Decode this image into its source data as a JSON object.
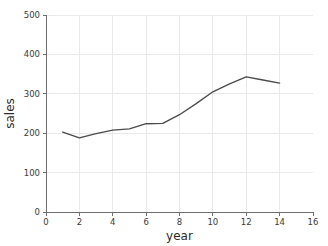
{
  "chart_data": {
    "type": "line",
    "title": "",
    "xlabel": "year",
    "ylabel": "sales",
    "xlim": [
      0,
      16
    ],
    "ylim": [
      0,
      500
    ],
    "grid": true,
    "legend": false,
    "x_ticks": [
      0,
      2,
      4,
      6,
      8,
      10,
      12,
      14,
      16
    ],
    "y_ticks": [
      0,
      100,
      200,
      300,
      400,
      500
    ],
    "x_tick_labels": [
      "0",
      "2",
      "4",
      "6",
      "8",
      "10",
      "12",
      "14",
      "16"
    ],
    "y_tick_labels": [
      "0",
      "100",
      "200",
      "300",
      "400",
      "500"
    ],
    "series": [
      {
        "name": "sales",
        "color": "#4a4a4a",
        "x": [
          1,
          2,
          3,
          4,
          5,
          6,
          7,
          8,
          9,
          10,
          11,
          12,
          13,
          14
        ],
        "values": [
          203,
          188,
          199,
          208,
          211,
          224,
          225,
          247,
          275,
          305,
          325,
          343,
          335,
          327
        ]
      }
    ]
  },
  "figure": {
    "background_color": "#ffffff",
    "grid_color": "#e9e9e9",
    "axis_color": "#6e6e6e",
    "text_color": "#2b2b2b"
  }
}
